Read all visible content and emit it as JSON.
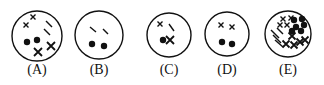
{
  "figure": {
    "panels": [
      {
        "label": "(A)",
        "cx": 37,
        "cy": 36,
        "r": 25,
        "dots": [
          [
            27,
            42
          ],
          [
            37,
            40
          ]
        ],
        "crosses": [
          [
            33,
            17,
            2.5
          ],
          [
            26,
            25,
            2.5
          ],
          [
            38,
            52,
            4
          ],
          [
            51,
            46,
            4
          ]
        ],
        "dashes": [
          [
            46,
            21,
            52,
            27
          ],
          [
            44,
            29,
            50,
            35
          ]
        ]
      },
      {
        "label": "(B)",
        "cx": 99,
        "cy": 35,
        "r": 24,
        "dots": [
          [
            92,
            44
          ],
          [
            104,
            46
          ]
        ],
        "dashes": [
          [
            90,
            27,
            96,
            32
          ],
          [
            103,
            29,
            108,
            34
          ]
        ],
        "crosses": []
      },
      {
        "label": "(C)",
        "cx": 169,
        "cy": 35,
        "r": 22,
        "dots": [
          [
            163,
            40
          ]
        ],
        "crosses": [
          [
            160,
            24,
            2.5
          ],
          [
            170,
            40,
            4
          ]
        ],
        "dashes": [
          [
            169,
            24,
            174,
            31
          ]
        ]
      },
      {
        "label": "(D)",
        "cx": 227,
        "cy": 34,
        "r": 22,
        "dots": [
          [
            222,
            42
          ],
          [
            232,
            44
          ]
        ],
        "crosses": [
          [
            221,
            25,
            2.5
          ],
          [
            232,
            27,
            2.5
          ]
        ],
        "dashes": []
      },
      {
        "label": "(E)",
        "cx": 288,
        "cy": 34,
        "r": 23,
        "dots": [
          [
            294,
            20
          ],
          [
            302,
            19
          ],
          [
            304,
            25
          ],
          [
            296,
            27
          ],
          [
            301,
            31
          ],
          [
            292,
            31
          ]
        ],
        "crosses": [
          [
            283,
            19,
            2.5
          ],
          [
            291,
            18,
            2.5
          ],
          [
            280,
            25,
            2.5
          ],
          [
            287,
            25,
            2.5
          ],
          [
            292,
            36,
            3.5
          ],
          [
            300,
            42,
            3.5
          ],
          [
            286,
            44,
            3.5
          ],
          [
            294,
            45,
            3.5
          ],
          [
            305,
            40,
            3.5
          ]
        ],
        "dashes": [
          [
            271,
            30,
            279,
            38
          ],
          [
            273,
            35,
            281,
            43
          ],
          [
            275,
            40,
            283,
            47
          ],
          [
            277,
            28,
            283,
            34
          ]
        ],
        "hatched_fill": false
      }
    ]
  }
}
